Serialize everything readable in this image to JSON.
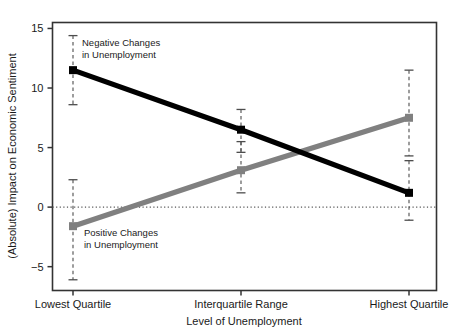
{
  "chart_data": {
    "type": "line",
    "title": "",
    "xlabel": "Level of Unemployment",
    "ylabel": "(Absolute) Impact on Economic Sentiment",
    "categories": [
      "Lowest Quartile",
      "Interquartile Range",
      "Highest Quartile"
    ],
    "ylim": [
      -7.0,
      15.5
    ],
    "yticks": [
      -5,
      0,
      5,
      10,
      15
    ],
    "ytick_labels": [
      "−5",
      "0",
      "5",
      "10",
      "15"
    ],
    "grid": false,
    "zero_line": 0,
    "legend_position": "inline-annotations",
    "series": [
      {
        "name": "Negative Changes in Unemployment",
        "color": "#000000",
        "values": [
          11.5,
          6.5,
          1.2
        ],
        "ci_low": [
          8.6,
          4.6,
          -1.1
        ],
        "ci_high": [
          14.4,
          8.2,
          3.9
        ]
      },
      {
        "name": "Positive Changes in Unemployment",
        "color": "#808080",
        "values": [
          -1.6,
          3.1,
          7.5
        ],
        "ci_low": [
          -6.1,
          1.2,
          4.3
        ],
        "ci_high": [
          2.3,
          5.5,
          11.5
        ]
      }
    ],
    "annotations": [
      {
        "id": "negative-changes-label",
        "lines": [
          "Negative Changes",
          "in Unemployment"
        ],
        "x_px": 82,
        "y_px": 46,
        "color": "#1a1a1a"
      },
      {
        "id": "positive-changes-label",
        "lines": [
          "Positive Changes",
          "in Unemployment"
        ],
        "x_px": 84,
        "y_px": 236,
        "color": "#1a1a1a"
      }
    ]
  },
  "colors": {
    "negative_series": "#000000",
    "positive_series": "#808080",
    "frame": "#333333",
    "zero_line": "#555555",
    "errorbar": "#4d4d4d",
    "background": "#ffffff"
  }
}
